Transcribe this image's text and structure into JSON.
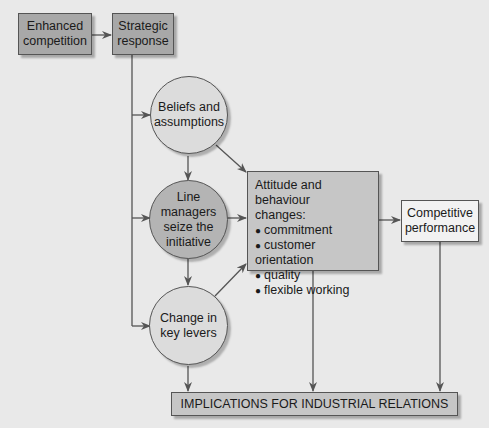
{
  "diagram": {
    "nodes": {
      "enhanced_competition": {
        "line1": "Enhanced",
        "line2": "competition"
      },
      "strategic_response": {
        "line1": "Strategic",
        "line2": "response"
      },
      "beliefs": {
        "line1": "Beliefs and",
        "line2": "assumptions"
      },
      "line_managers": {
        "line1": "Line",
        "line2": "managers",
        "line3": "seize the",
        "line4": "initiative"
      },
      "key_levers": {
        "line1": "Change in",
        "line2": "key levers"
      },
      "attitude": {
        "title1": "Attitude and behaviour",
        "title2": "changes:",
        "items": [
          "commitment",
          "customer orientation",
          "quality",
          "flexible working"
        ]
      },
      "competitive": {
        "line1": "Competitive",
        "line2": "performance"
      },
      "implications": {
        "label": "IMPLICATIONS FOR INDUSTRIAL RELATIONS"
      }
    },
    "edges": [
      {
        "from": "Enhanced competition",
        "to": "Strategic response"
      },
      {
        "from": "Strategic response",
        "to": "Beliefs and assumptions"
      },
      {
        "from": "Strategic response",
        "to": "Line managers seize the initiative"
      },
      {
        "from": "Strategic response",
        "to": "Change in key levers"
      },
      {
        "from": "Beliefs and assumptions",
        "to": "Line managers seize the initiative"
      },
      {
        "from": "Line managers seize the initiative",
        "to": "Change in key levers"
      },
      {
        "from": "Beliefs and assumptions",
        "to": "Attitude and behaviour changes"
      },
      {
        "from": "Line managers seize the initiative",
        "to": "Attitude and behaviour changes"
      },
      {
        "from": "Change in key levers",
        "to": "Attitude and behaviour changes"
      },
      {
        "from": "Attitude and behaviour changes",
        "to": "Competitive performance"
      },
      {
        "from": "Change in key levers",
        "to": "Implications for industrial relations"
      },
      {
        "from": "Attitude and behaviour changes",
        "to": "Implications for industrial relations"
      },
      {
        "from": "Competitive performance",
        "to": "Implications for industrial relations"
      }
    ]
  }
}
